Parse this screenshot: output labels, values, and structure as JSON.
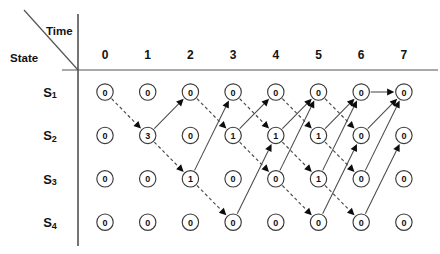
{
  "header": {
    "time_label": "Time",
    "state_label": "State"
  },
  "columns": [
    "0",
    "1",
    "2",
    "3",
    "4",
    "5",
    "6",
    "7"
  ],
  "states": [
    {
      "name": "S",
      "sub": "1"
    },
    {
      "name": "S",
      "sub": "2"
    },
    {
      "name": "S",
      "sub": "3"
    },
    {
      "name": "S",
      "sub": "4"
    }
  ],
  "chart_data": {
    "type": "diagram",
    "title": "",
    "xlabel": "Time",
    "ylabel": "State",
    "categories": [
      "0",
      "1",
      "2",
      "3",
      "4",
      "5",
      "6",
      "7"
    ],
    "row_labels": [
      "S1",
      "S2",
      "S3",
      "S4"
    ],
    "grid": false,
    "node_values": [
      [
        "0",
        "0",
        "0",
        "0",
        "0",
        "0",
        "0",
        "0"
      ],
      [
        "0",
        "3",
        "0",
        "1",
        "1",
        "1",
        "0",
        "0"
      ],
      [
        "0",
        "0",
        "1",
        "0",
        "0",
        "1",
        "0",
        "0"
      ],
      [
        "0",
        "0",
        "0",
        "0",
        "0",
        "0",
        "0",
        "0"
      ]
    ],
    "edges": [
      {
        "from": [
          0,
          0
        ],
        "to": [
          1,
          1
        ],
        "style": "dashed"
      },
      {
        "from": [
          1,
          1
        ],
        "to": [
          0,
          2
        ],
        "style": "solid"
      },
      {
        "from": [
          1,
          1
        ],
        "to": [
          2,
          2
        ],
        "style": "dashed"
      },
      {
        "from": [
          0,
          2
        ],
        "to": [
          1,
          3
        ],
        "style": "dashed"
      },
      {
        "from": [
          2,
          2
        ],
        "to": [
          0,
          3
        ],
        "style": "solid"
      },
      {
        "from": [
          2,
          2
        ],
        "to": [
          3,
          3
        ],
        "style": "dashed"
      },
      {
        "from": [
          0,
          3
        ],
        "to": [
          1,
          4
        ],
        "style": "dashed"
      },
      {
        "from": [
          1,
          3
        ],
        "to": [
          0,
          4
        ],
        "style": "solid"
      },
      {
        "from": [
          1,
          3
        ],
        "to": [
          2,
          4
        ],
        "style": "dashed"
      },
      {
        "from": [
          3,
          3
        ],
        "to": [
          1,
          4
        ],
        "style": "solid"
      },
      {
        "from": [
          0,
          4
        ],
        "to": [
          1,
          5
        ],
        "style": "dashed"
      },
      {
        "from": [
          1,
          4
        ],
        "to": [
          0,
          5
        ],
        "style": "solid"
      },
      {
        "from": [
          1,
          4
        ],
        "to": [
          2,
          5
        ],
        "style": "dashed"
      },
      {
        "from": [
          2,
          4
        ],
        "to": [
          0,
          5
        ],
        "style": "solid"
      },
      {
        "from": [
          2,
          4
        ],
        "to": [
          3,
          5
        ],
        "style": "dashed"
      },
      {
        "from": [
          0,
          5
        ],
        "to": [
          1,
          6
        ],
        "style": "dashed"
      },
      {
        "from": [
          1,
          5
        ],
        "to": [
          0,
          6
        ],
        "style": "solid"
      },
      {
        "from": [
          1,
          5
        ],
        "to": [
          2,
          6
        ],
        "style": "dashed"
      },
      {
        "from": [
          2,
          5
        ],
        "to": [
          0,
          6
        ],
        "style": "solid"
      },
      {
        "from": [
          2,
          5
        ],
        "to": [
          3,
          6
        ],
        "style": "dashed"
      },
      {
        "from": [
          3,
          5
        ],
        "to": [
          1,
          6
        ],
        "style": "solid"
      },
      {
        "from": [
          1,
          6
        ],
        "to": [
          0,
          7
        ],
        "style": "solid"
      },
      {
        "from": [
          2,
          6
        ],
        "to": [
          0,
          7
        ],
        "style": "solid"
      },
      {
        "from": [
          3,
          6
        ],
        "to": [
          1,
          7
        ],
        "style": "solid"
      },
      {
        "from": [
          0,
          6
        ],
        "to": [
          0,
          7
        ],
        "style": "solid"
      }
    ]
  },
  "geometry": {
    "col_x0": 105,
    "col_step": 42.7,
    "row_y0": 92,
    "row_step": 43.4,
    "node_radius": 8.2,
    "axis_vertical_x": 78,
    "axis_vertical_top": 14,
    "axis_vertical_bottom": 246,
    "axis_horizontal_y": 70,
    "axis_horizontal_x1": 62,
    "axis_horizontal_x2": 438,
    "diag_x1": 24,
    "diag_y1": 10,
    "diag_x2": 78,
    "diag_y2": 70,
    "time_label_x": 46,
    "time_label_y": 31,
    "state_label_x": 10,
    "state_label_y": 58
  },
  "colors": {
    "background": "#ffffff",
    "ink": "#121212",
    "line": "#4a4a4a",
    "arrow": "#0c0c0c"
  }
}
